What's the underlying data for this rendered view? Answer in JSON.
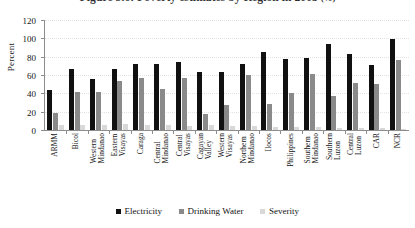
{
  "chart_data": {
    "type": "bar",
    "title": "Figure 5.6: Poverty estimates by Region in 2003",
    "title_suffix": "(%)",
    "xlabel": "",
    "ylabel": "Percent",
    "ylim": [
      0,
      120
    ],
    "yticks": [
      0,
      20,
      40,
      60,
      80,
      100,
      120
    ],
    "grid": true,
    "legend_position": "bottom",
    "categories": [
      "ARMM",
      "Bicol",
      "Western Mindanao",
      "Eastern Visayas",
      "Caraga",
      "Central Mindanao",
      "Central Visayas",
      "Cagayan Valley",
      "Western Visayas",
      "Northern Mindanao",
      "Ilocos",
      "Philippines",
      "Southern Mindanao",
      "Southern Luzon",
      "Central Luzon",
      "CAR",
      "NCR"
    ],
    "series": [
      {
        "name": "Electricity",
        "color": "#111111",
        "values": [
          44,
          67,
          56,
          67,
          72,
          72,
          74,
          63,
          63,
          72,
          85,
          78,
          79,
          94,
          83,
          71,
          99
        ]
      },
      {
        "name": "Drinking Water",
        "color": "#8a8a8a",
        "values": [
          19,
          42,
          42,
          53,
          57,
          45,
          57,
          18,
          27,
          60,
          28,
          40,
          61,
          37,
          51,
          50,
          76
        ]
      },
      {
        "name": "Severity",
        "color": "#d8d8d8",
        "values": [
          6,
          6,
          6,
          7,
          6,
          5,
          4,
          5,
          4,
          4,
          3,
          3,
          3,
          2,
          2,
          2,
          1
        ]
      }
    ]
  }
}
